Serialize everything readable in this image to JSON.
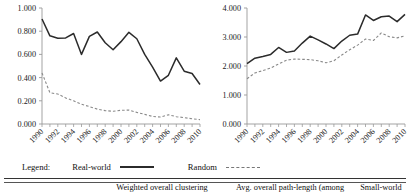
{
  "figure": {
    "legend": {
      "title": "Legend:",
      "series": [
        {
          "label": "Real-world",
          "style": "solid",
          "color": "#2b2b2b"
        },
        {
          "label": "Random",
          "style": "dashed",
          "color": "#777777"
        }
      ]
    },
    "table_header": {
      "col_spacer": "",
      "col_1": "Weighted overall clustering",
      "col_2": "Avg. overall path-length (among",
      "col_3": "Small-world"
    }
  },
  "chart_data": [
    {
      "type": "line",
      "id": "weighted-overall-clustering",
      "title": "",
      "xlabel": "",
      "ylabel": "",
      "xlim": [
        1990,
        2010
      ],
      "ylim": [
        0.0,
        1.0
      ],
      "ytick_labels": [
        "0.000",
        "0.200",
        "0.400",
        "0.600",
        "0.800",
        "1.000"
      ],
      "ytick_values": [
        0.0,
        0.2,
        0.4,
        0.6,
        0.8,
        1.0
      ],
      "xtick_labels": [
        "1990",
        "1992",
        "1994",
        "1996",
        "1998",
        "2000",
        "2002",
        "2004",
        "2006",
        "2008",
        "2010"
      ],
      "xtick_values": [
        1990,
        1992,
        1994,
        1996,
        1998,
        2000,
        2002,
        2004,
        2006,
        2008,
        2010
      ],
      "grid": false,
      "legend_position": "below-figure",
      "x": [
        1990,
        1991,
        1992,
        1993,
        1994,
        1995,
        1996,
        1997,
        1998,
        1999,
        2000,
        2001,
        2002,
        2003,
        2004,
        2005,
        2006,
        2007,
        2008,
        2009,
        2010
      ],
      "series": [
        {
          "name": "Real-world",
          "style": "solid",
          "values": [
            0.905,
            0.76,
            0.74,
            0.742,
            0.78,
            0.6,
            0.755,
            0.793,
            0.7,
            0.64,
            0.71,
            0.79,
            0.735,
            0.6,
            0.49,
            0.37,
            0.42,
            0.57,
            0.455,
            0.435,
            0.34
          ]
        },
        {
          "name": "Random",
          "style": "dashed",
          "values": [
            0.44,
            0.27,
            0.258,
            0.225,
            0.2,
            0.17,
            0.15,
            0.128,
            0.115,
            0.11,
            0.118,
            0.12,
            0.1,
            0.083,
            0.065,
            0.06,
            0.08,
            0.063,
            0.055,
            0.045,
            0.038
          ]
        }
      ]
    },
    {
      "type": "line",
      "id": "avg-overall-path-length",
      "title": "",
      "xlabel": "",
      "ylabel": "",
      "xlim": [
        1990,
        2010
      ],
      "ylim": [
        0.0,
        4.0
      ],
      "ytick_labels": [
        "0.000",
        "1.000",
        "2.000",
        "3.000",
        "4.000"
      ],
      "ytick_values": [
        0.0,
        1.0,
        2.0,
        3.0,
        4.0
      ],
      "xtick_labels": [
        "1990",
        "1992",
        "1994",
        "1996",
        "1998",
        "2000",
        "2002",
        "2004",
        "2006",
        "2008",
        "2010"
      ],
      "xtick_values": [
        1990,
        1992,
        1994,
        1996,
        1998,
        2000,
        2002,
        2004,
        2006,
        2008,
        2010
      ],
      "grid": false,
      "legend_position": "below-figure",
      "x": [
        1990,
        1991,
        1992,
        1993,
        1994,
        1995,
        1996,
        1997,
        1998,
        1999,
        2000,
        2001,
        2002,
        2003,
        2004,
        2005,
        2006,
        2007,
        2008,
        2009,
        2010
      ],
      "series": [
        {
          "name": "Real-world",
          "style": "solid",
          "values": [
            2.08,
            2.27,
            2.33,
            2.4,
            2.64,
            2.47,
            2.52,
            2.79,
            3.03,
            2.9,
            2.76,
            2.6,
            2.86,
            3.06,
            3.1,
            3.76,
            3.57,
            3.7,
            3.72,
            3.53,
            3.78
          ]
        },
        {
          "name": "Random",
          "style": "dashed",
          "values": [
            1.56,
            1.76,
            1.84,
            1.93,
            2.07,
            2.2,
            2.24,
            2.23,
            2.22,
            2.18,
            2.11,
            2.18,
            2.38,
            2.56,
            2.72,
            2.93,
            2.88,
            3.14,
            3.01,
            2.97,
            3.04
          ]
        }
      ]
    }
  ]
}
